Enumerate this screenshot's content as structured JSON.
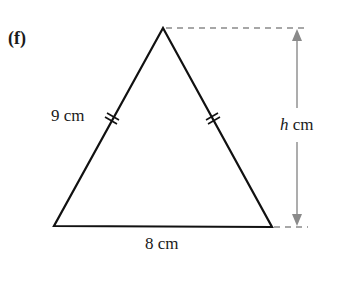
{
  "figure": {
    "part_label": "(f)",
    "side_label": "9 cm",
    "base_label": "8 cm",
    "height_var": "h",
    "height_unit": "cm",
    "shape": "isosceles triangle with two equal sides marked by double tick marks",
    "colors": {
      "outline": "#111111",
      "dimension": "#8a8a8a",
      "text": "#1a1a1a"
    }
  }
}
